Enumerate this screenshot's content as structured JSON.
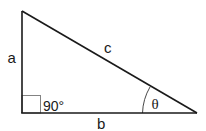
{
  "diagram": {
    "type": "right-triangle",
    "labels": {
      "side_vertical": "a",
      "hypotenuse": "c",
      "side_horizontal": "b",
      "right_angle": "90°",
      "angle": "θ"
    },
    "colors": {
      "stroke": "#1a1a1a",
      "right_angle_box": "#666666",
      "background": "#ffffff"
    }
  }
}
